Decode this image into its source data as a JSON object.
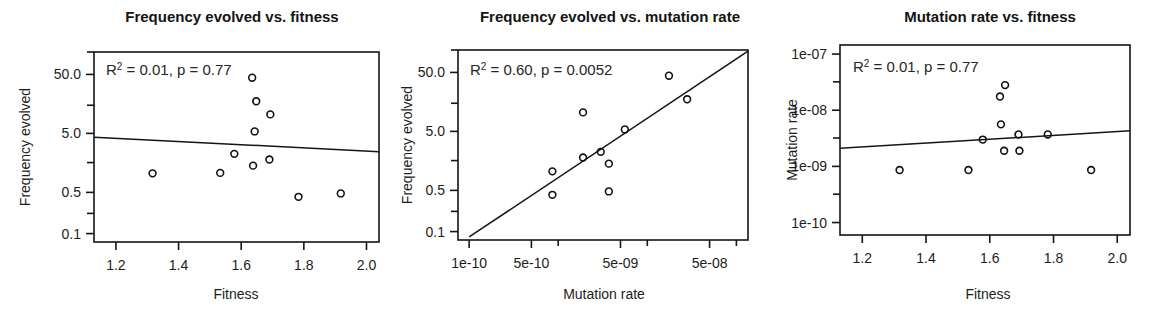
{
  "figure": {
    "background": "#ffffff",
    "foreground": "#151515",
    "width": 1164,
    "height": 316
  },
  "chart_data": [
    {
      "type": "scatter",
      "title": "Frequency evolved vs. fitness",
      "xlabel": "Fitness",
      "ylabel": "Frequency evolved",
      "xscale": "linear",
      "yscale": "log",
      "xlim": [
        1.13,
        2.04
      ],
      "ylim": [
        0.072,
        120
      ],
      "grid": false,
      "legend": null,
      "annotation": {
        "r_squared": "0.01",
        "p_value": "0.77",
        "text": "R2 = 0.01, p = 0.77"
      },
      "xticks": [
        {
          "value": 1.2,
          "label": "1.2"
        },
        {
          "value": 1.4,
          "label": "1.4"
        },
        {
          "value": 1.6,
          "label": "1.6"
        },
        {
          "value": 1.8,
          "label": "1.8"
        },
        {
          "value": 2.0,
          "label": "2.0"
        }
      ],
      "yticks": [
        {
          "value": 50.0,
          "label": "50.0"
        },
        {
          "value": 5.0,
          "label": "5.0"
        },
        {
          "value": 0.5,
          "label": "0.5"
        },
        {
          "value": 0.1,
          "label": "0.1"
        }
      ],
      "yminorticks": [
        120,
        15,
        1.6,
        0.22
      ],
      "points": [
        {
          "x": 1.317,
          "y": 1.05
        },
        {
          "x": 1.533,
          "y": 1.07
        },
        {
          "x": 1.578,
          "y": 2.25
        },
        {
          "x": 1.635,
          "y": 44.0
        },
        {
          "x": 1.638,
          "y": 1.42
        },
        {
          "x": 1.643,
          "y": 5.4
        },
        {
          "x": 1.648,
          "y": 17.5
        },
        {
          "x": 1.69,
          "y": 1.8
        },
        {
          "x": 1.693,
          "y": 10.5
        },
        {
          "x": 1.783,
          "y": 0.42
        },
        {
          "x": 1.918,
          "y": 0.48
        }
      ],
      "fitline": {
        "x1": 1.13,
        "y1": 4.3,
        "x2": 2.04,
        "y2": 2.45
      }
    },
    {
      "type": "scatter",
      "title": "Frequency evolved vs. mutation rate",
      "xlabel": "Mutation rate",
      "ylabel": "Frequency evolved",
      "xscale": "log",
      "yscale": "log",
      "xlim": [
        7.5e-11,
        1.35e-07
      ],
      "ylim": [
        0.072,
        120
      ],
      "grid": false,
      "legend": null,
      "annotation": {
        "r_squared": "0.60",
        "p_value": "0.0052",
        "text": "R2 = 0.60, p = 0.0052"
      },
      "xticks": [
        {
          "value": 1e-10,
          "label": "1e-10"
        },
        {
          "value": 5e-10,
          "label": "5e-10"
        },
        {
          "value": 5e-09,
          "label": "5e-09"
        },
        {
          "value": 5e-08,
          "label": "5e-08"
        }
      ],
      "xminorticks": [
        1e-09,
        1e-08,
        1e-07
      ],
      "yticks": [
        {
          "value": 50.0,
          "label": "50.0"
        },
        {
          "value": 5.0,
          "label": "5.0"
        },
        {
          "value": 0.5,
          "label": "0.5"
        },
        {
          "value": 0.1,
          "label": "0.1"
        }
      ],
      "yminorticks": [
        120,
        15,
        1.6,
        0.22
      ],
      "points": [
        {
          "x": 8.6e-10,
          "y": 1.05
        },
        {
          "x": 8.6e-10,
          "y": 0.42
        },
        {
          "x": 1.9e-09,
          "y": 1.8
        },
        {
          "x": 1.9e-09,
          "y": 10.5
        },
        {
          "x": 3e-09,
          "y": 2.25
        },
        {
          "x": 3.7e-09,
          "y": 1.42
        },
        {
          "x": 3.7e-09,
          "y": 0.48
        },
        {
          "x": 5.6e-09,
          "y": 5.4
        },
        {
          "x": 1.75e-08,
          "y": 44.0
        },
        {
          "x": 2.8e-08,
          "y": 17.5
        }
      ],
      "fitline": {
        "x1": 1e-10,
        "y1": 0.081,
        "x2": 1.35e-07,
        "y2": 115
      }
    },
    {
      "type": "scatter",
      "title": "Mutation rate vs. fitness",
      "xlabel": "Fitness",
      "ylabel": "Mutation rate",
      "xscale": "linear",
      "yscale": "log",
      "xlim": [
        1.13,
        2.04
      ],
      "ylim": [
        6e-11,
        1.45e-07
      ],
      "grid": false,
      "legend": null,
      "annotation": {
        "r_squared": "0.01",
        "p_value": "0.77",
        "text": "R2 = 0.01, p = 0.77"
      },
      "xticks": [
        {
          "value": 1.2,
          "label": "1.2"
        },
        {
          "value": 1.4,
          "label": "1.4"
        },
        {
          "value": 1.6,
          "label": "1.6"
        },
        {
          "value": 1.8,
          "label": "1.8"
        },
        {
          "value": 2.0,
          "label": "2.0"
        }
      ],
      "yticks": [
        {
          "value": 1e-07,
          "label": "1e-07"
        },
        {
          "value": 1e-08,
          "label": "1e-08"
        },
        {
          "value": 1e-09,
          "label": "1e-09"
        },
        {
          "value": 1e-10,
          "label": "1e-10"
        }
      ],
      "yminorticks": [
        3.2e-08,
        3.2e-09,
        3.2e-10
      ],
      "points": [
        {
          "x": 1.317,
          "y": 8.6e-10
        },
        {
          "x": 1.533,
          "y": 8.6e-10
        },
        {
          "x": 1.578,
          "y": 3e-09
        },
        {
          "x": 1.635,
          "y": 5.6e-09
        },
        {
          "x": 1.632,
          "y": 1.75e-08
        },
        {
          "x": 1.648,
          "y": 2.8e-08
        },
        {
          "x": 1.645,
          "y": 1.9e-09
        },
        {
          "x": 1.69,
          "y": 3.7e-09
        },
        {
          "x": 1.693,
          "y": 1.9e-09
        },
        {
          "x": 1.782,
          "y": 3.7e-09
        },
        {
          "x": 1.918,
          "y": 8.6e-10
        }
      ],
      "fitline": {
        "x1": 1.13,
        "y1": 2.1e-09,
        "x2": 2.04,
        "y2": 4.3e-09
      }
    }
  ]
}
